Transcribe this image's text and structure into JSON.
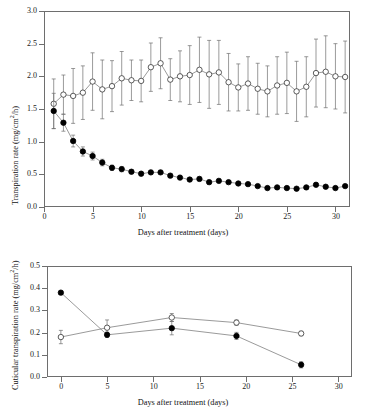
{
  "figure": {
    "background": "#ffffff",
    "line_color": "#6e6e6e",
    "marker_fill_closed": "#000000",
    "marker_fill_open": "#ffffff",
    "marker_stroke": "#333333"
  },
  "chart_data": [
    {
      "id": "top-panel",
      "type": "line",
      "title": "",
      "xlabel": "Days after treatment (days)",
      "ylabel": "Transpiration rate (mg/cm2/h)",
      "ylabel_parts": {
        "prefix": "Transpiration rate (mg/cm",
        "sup": "2",
        "suffix": "/h)"
      },
      "xlim": [
        0,
        31.5
      ],
      "ylim": [
        0.0,
        3.0
      ],
      "xticks": [
        0,
        5,
        10,
        15,
        20,
        25,
        30
      ],
      "xticklabels": [
        "0",
        "5",
        "10",
        "15",
        "20",
        "25",
        "30"
      ],
      "yticks": [
        0.0,
        0.5,
        1.0,
        1.5,
        2.0,
        2.5,
        3.0
      ],
      "yticklabels": [
        "0.0",
        "0.5",
        "1.0",
        "1.5",
        "2.0",
        "2.5",
        "3.0"
      ],
      "grid": false,
      "legend": "none",
      "x": [
        1,
        2,
        3,
        4,
        5,
        6,
        7,
        8,
        9,
        10,
        11,
        12,
        13,
        14,
        15,
        16,
        17,
        18,
        19,
        20,
        21,
        22,
        23,
        24,
        25,
        26,
        27,
        28,
        29,
        30,
        31
      ],
      "series": [
        {
          "name": "open-circle-series",
          "marker": "open-circle",
          "values": [
            1.58,
            1.72,
            1.7,
            1.75,
            1.92,
            1.8,
            1.85,
            1.97,
            1.94,
            1.93,
            2.14,
            2.2,
            1.95,
            2.0,
            2.02,
            2.1,
            2.03,
            2.06,
            1.91,
            1.83,
            1.89,
            1.81,
            1.77,
            1.86,
            1.9,
            1.77,
            1.84,
            2.05,
            2.07,
            2.0,
            1.99
          ],
          "error": [
            0.38,
            0.3,
            0.42,
            0.41,
            0.44,
            0.45,
            0.39,
            0.41,
            0.31,
            0.32,
            0.37,
            0.39,
            0.32,
            0.39,
            0.45,
            0.5,
            0.52,
            0.49,
            0.44,
            0.36,
            0.41,
            0.39,
            0.39,
            0.44,
            0.47,
            0.46,
            0.46,
            0.52,
            0.55,
            0.5,
            0.55
          ]
        },
        {
          "name": "closed-circle-series",
          "marker": "closed-circle",
          "values": [
            1.47,
            1.29,
            1.01,
            0.85,
            0.78,
            0.68,
            0.6,
            0.58,
            0.54,
            0.51,
            0.53,
            0.53,
            0.48,
            0.45,
            0.42,
            0.43,
            0.38,
            0.4,
            0.38,
            0.36,
            0.35,
            0.32,
            0.29,
            0.3,
            0.29,
            0.28,
            0.3,
            0.34,
            0.31,
            0.29,
            0.32
          ],
          "error": [
            0.27,
            0.13,
            0.09,
            0.07,
            0.06,
            0.05,
            0.04,
            0.04,
            0.03,
            0.03,
            0.03,
            0.03,
            0.03,
            0.03,
            0.03,
            0.03,
            0.03,
            0.03,
            0.02,
            0.02,
            0.02,
            0.02,
            0.02,
            0.02,
            0.02,
            0.02,
            0.02,
            0.02,
            0.02,
            0.02,
            0.02
          ]
        }
      ]
    },
    {
      "id": "bottom-panel",
      "type": "line",
      "title": "",
      "xlabel": "Days after treatment (days)",
      "ylabel": "Cuticular transpiration rate (mg/cm2/h)",
      "ylabel_parts": {
        "prefix": "Cuticular transpiration rate (mg/cm",
        "sup": "2",
        "suffix": "/h)"
      },
      "xlim": [
        -1.5,
        31.5
      ],
      "ylim": [
        0.0,
        0.5
      ],
      "xticks": [
        0,
        5,
        10,
        15,
        20,
        25,
        30
      ],
      "xticklabels": [
        "0",
        "5",
        "10",
        "15",
        "20",
        "25",
        "30"
      ],
      "yticks": [
        0.0,
        0.1,
        0.2,
        0.3,
        0.4,
        0.5
      ],
      "yticklabels": [
        "0.0",
        "0.1",
        "0.2",
        "0.3",
        "0.4",
        "0.5"
      ],
      "grid": false,
      "legend": "none",
      "x": [
        0,
        5,
        12,
        19,
        26
      ],
      "series": [
        {
          "name": "open-circle-series",
          "marker": "open-circle",
          "values": [
            0.18,
            0.222,
            0.268,
            0.245,
            0.196
          ],
          "error": [
            0.03,
            0.035,
            0.018,
            0.012,
            0.01
          ]
        },
        {
          "name": "closed-circle-series",
          "marker": "closed-circle",
          "values": [
            0.38,
            0.19,
            0.22,
            0.185,
            0.055
          ],
          "error": [
            0.008,
            0.012,
            0.03,
            0.016,
            0.014
          ]
        }
      ]
    }
  ]
}
